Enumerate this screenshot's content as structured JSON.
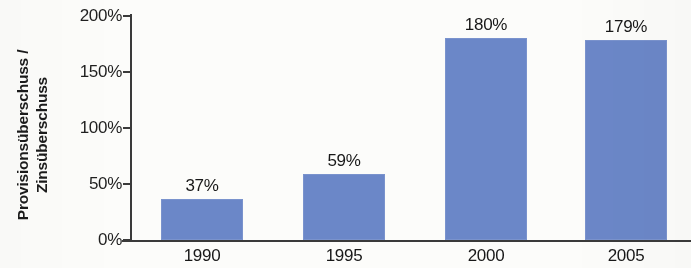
{
  "chart_data": {
    "type": "bar",
    "title": "",
    "subtitle": "",
    "xlabel": "",
    "ylabel": "Provisionsüberschuss / Zinsüberschuss",
    "ylabel_lines": [
      "Provisionsüberschuss /",
      "Zinsüberschuss"
    ],
    "categories": [
      "1990",
      "1995",
      "2000",
      "2005"
    ],
    "values": [
      37,
      59,
      180,
      179
    ],
    "value_labels": [
      "37%",
      "59%",
      "180%",
      "179%"
    ],
    "ylim": [
      0,
      200
    ],
    "yticks": [
      0,
      50,
      100,
      150,
      200
    ],
    "ytick_labels": [
      "0%",
      "50%",
      "100%",
      "150%",
      "200%"
    ],
    "grid": false,
    "legend": false,
    "legend_position": "none",
    "series": [
      {
        "name": "Provisionsüberschuss / Zinsüberschuss",
        "values": [
          37,
          59,
          180,
          179
        ]
      }
    ],
    "bar_color": "#6b87c8",
    "axis_color": "#3a3a3a",
    "text_color": "#181818",
    "background_color": "#fcfcfa"
  }
}
